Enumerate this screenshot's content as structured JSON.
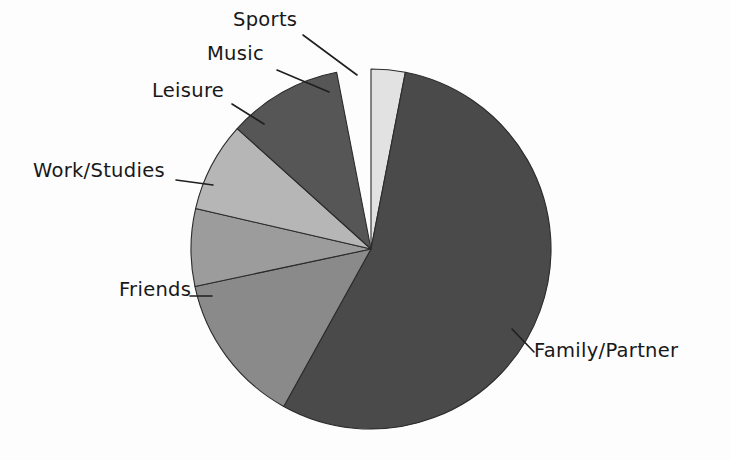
{
  "chart_data": {
    "type": "pie",
    "title": "",
    "subtitle": "",
    "xlabel": "",
    "ylabel": "",
    "legend_position": "none",
    "grid": false,
    "labels_outside": true,
    "categories": [
      "Sports",
      "Family/Partner",
      "Friends",
      "Work/Studies",
      "Leisure",
      "Music"
    ],
    "values": [
      3.1,
      55.0,
      13.6,
      6.9,
      8.1,
      10.3
    ],
    "units": "percent",
    "start_angle_deg": 0,
    "direction": "clockwise",
    "slices": [
      {
        "label": "Sports",
        "value": 3.1,
        "start_deg": 0,
        "end_deg": 11,
        "color": "#e2e2e2"
      },
      {
        "label": "Family/Partner",
        "value": 55.0,
        "start_deg": 11,
        "end_deg": 209,
        "color": "#4a4a4a"
      },
      {
        "label": "Friends",
        "value": 13.6,
        "start_deg": 209,
        "end_deg": 258,
        "color": "#8a8a8a"
      },
      {
        "label": "Work/Studies",
        "value": 6.9,
        "start_deg": 258,
        "end_deg": 283,
        "color": "#9c9c9c"
      },
      {
        "label": "Leisure",
        "value": 8.1,
        "start_deg": 283,
        "end_deg": 312,
        "color": "#b6b6b6"
      },
      {
        "label": "Music",
        "value": 10.3,
        "start_deg": 312,
        "end_deg": 349,
        "color": "#565656"
      }
    ],
    "geometry": {
      "center_x": 371,
      "center_y": 249,
      "radius": 180
    },
    "colors": {
      "outline": "#2b2b2b",
      "background": "#fdfdfd",
      "label_text": "#181818",
      "leader_line": "#1f1f1f"
    }
  },
  "labels": {
    "sports": "Sports",
    "family_partner": "Family/Partner",
    "friends": "Friends",
    "work_studies": "Work/Studies",
    "leisure": "Leisure",
    "music": "Music"
  }
}
